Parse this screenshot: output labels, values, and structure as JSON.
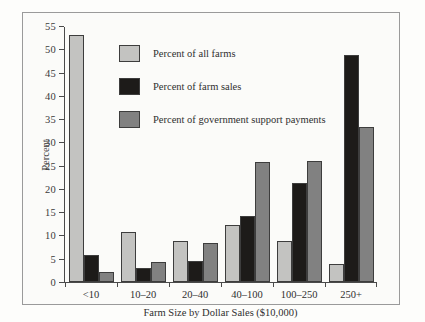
{
  "chart_data": {
    "type": "bar",
    "title": "",
    "xlabel": "Farm Size by Dollar Sales ($10,000)",
    "ylabel": "Percent",
    "ylim": [
      0,
      55
    ],
    "yticks": [
      0,
      5,
      10,
      15,
      20,
      25,
      30,
      35,
      40,
      45,
      50,
      55
    ],
    "grid": false,
    "legend_position": "inside-upper-left",
    "categories": [
      "<10",
      "10–20",
      "20–40",
      "40–100",
      "100–250",
      "250+"
    ],
    "series": [
      {
        "name": "Percent of all farms",
        "color": "#c3c3c1",
        "values": [
          53,
          10.8,
          8.9,
          12.3,
          8.8,
          3.8
        ]
      },
      {
        "name": "Percent of farm sales",
        "color": "#1d1b19",
        "values": [
          5.9,
          3.0,
          4.6,
          14.1,
          21.2,
          48.7
        ]
      },
      {
        "name": "Percent of government support payments",
        "color": "#818181",
        "values": [
          2.2,
          4.3,
          8.4,
          25.7,
          25.9,
          33.2
        ]
      }
    ]
  },
  "figure": {
    "border_color": "#9a9a9a",
    "background": "#fbfbf9"
  }
}
